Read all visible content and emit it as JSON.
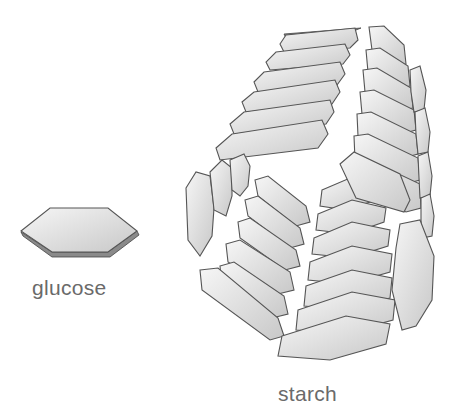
{
  "diagram": {
    "labels": {
      "glucose": "glucose",
      "starch": "starch"
    },
    "colors": {
      "tile_light": "#f4f4f4",
      "tile_dark": "#c9c9c9",
      "outline": "#555555",
      "label_text": "#6a6a6a"
    },
    "elements": [
      {
        "name": "glucose-unit",
        "shape": "hexagon"
      },
      {
        "name": "starch-helix",
        "shape": "helical stack of hexagonal glucose units"
      }
    ]
  }
}
